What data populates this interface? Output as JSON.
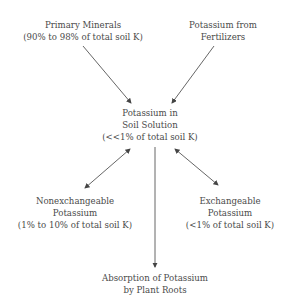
{
  "diagram": {
    "nodes": {
      "primary_minerals": {
        "line1": "Primary Minerals",
        "line2": "(90% to 98% of total soil K)"
      },
      "fertilizers": {
        "line1": "Potassium from",
        "line2": "Fertilizers"
      },
      "soil_solution": {
        "line1": "Potassium in",
        "line2": "Soil Solution",
        "line3": "(<<1% of total soil K)"
      },
      "nonexchangeable": {
        "line1": "Nonexchangeable",
        "line2": "Potassium",
        "line3": "(1% to 10% of total soil K)"
      },
      "exchangeable": {
        "line1": "Exchangeable",
        "line2": "Potassium",
        "line3": "(<1% of total soil K)"
      },
      "absorption": {
        "line1": "Absorption of Potassium",
        "line2": "by Plant Roots"
      }
    },
    "edges": [
      {
        "from": "primary_minerals",
        "to": "soil_solution",
        "type": "one-way"
      },
      {
        "from": "fertilizers",
        "to": "soil_solution",
        "type": "one-way"
      },
      {
        "from": "soil_solution",
        "to": "nonexchangeable",
        "type": "two-way"
      },
      {
        "from": "soil_solution",
        "to": "exchangeable",
        "type": "two-way"
      },
      {
        "from": "soil_solution",
        "to": "absorption",
        "type": "one-way"
      }
    ]
  }
}
